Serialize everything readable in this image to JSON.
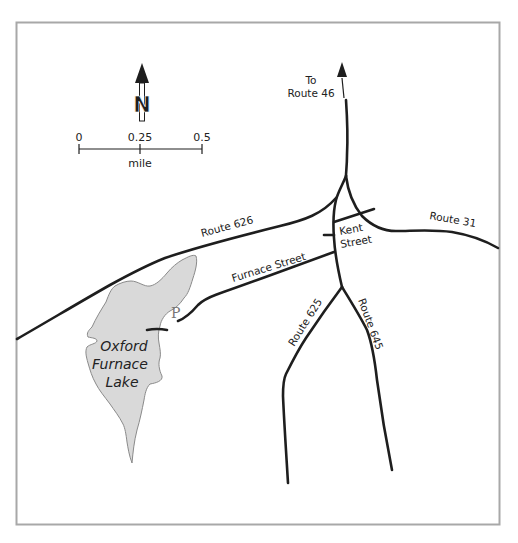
{
  "map": {
    "frame_color": "#a8a8a8",
    "road_color": "#1e1e1e",
    "lake_fill": "#d9d9d9",
    "lake_stroke": "#8a8a8a",
    "north_arrow": {
      "icon": "north-arrow-icon",
      "label": "N"
    },
    "scale_bar": {
      "ticks": [
        "0",
        "0.25",
        "0.5"
      ],
      "unit": "mile"
    },
    "lake": {
      "name_lines": [
        "Oxford",
        "Furnace",
        "Lake"
      ]
    },
    "parking": {
      "icon": "parking-icon",
      "label": "P"
    },
    "roads": {
      "to_route_46": {
        "line1": "To",
        "line2": "Route 46"
      },
      "route_626": "Route 626",
      "route_31": "Route 31",
      "kent_street": {
        "line1": "Kent",
        "line2": "Street"
      },
      "furnace_street": "Furnace Street",
      "route_625": "Route 625",
      "route_645": "Route 645"
    }
  }
}
